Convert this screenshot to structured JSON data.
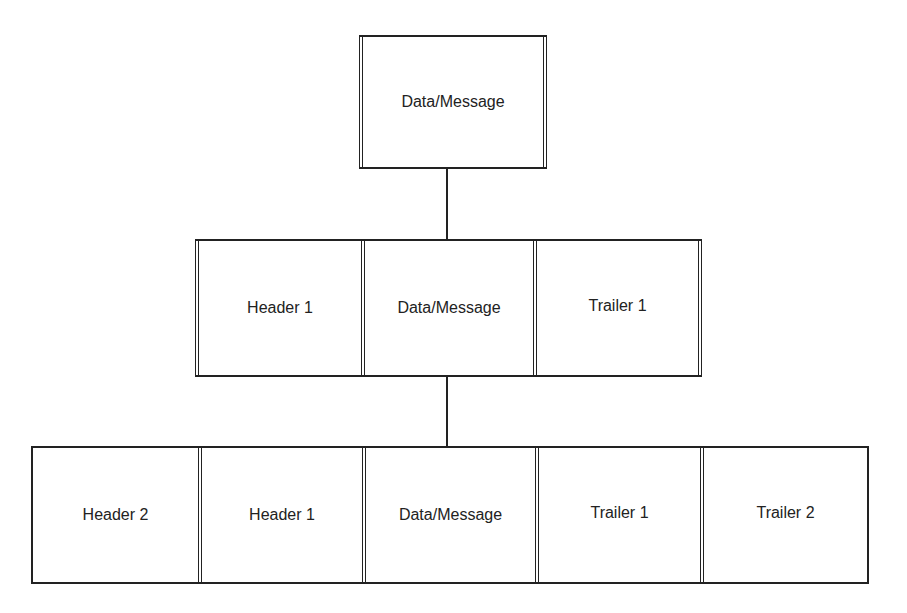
{
  "diagram": {
    "type": "encapsulation-hierarchy",
    "levels": [
      {
        "cells": [
          "Data/Message"
        ]
      },
      {
        "cells": [
          "Header 1",
          "Data/Message",
          "Trailer 1"
        ]
      },
      {
        "cells": [
          "Header 2",
          "Header 1",
          "Data/Message",
          "Trailer 1",
          "Trailer 2"
        ]
      }
    ],
    "line_color": "#222222",
    "background": "#ffffff"
  }
}
